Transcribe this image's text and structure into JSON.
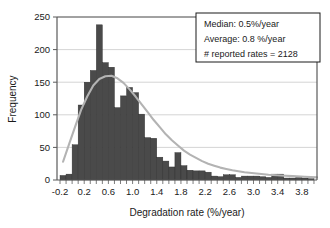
{
  "chart_data": {
    "type": "bar",
    "title": "",
    "xlabel": "Degradation rate (%/year)",
    "ylabel": "Frequency",
    "xlim": [
      -0.25,
      4.05
    ],
    "ylim": [
      0,
      250
    ],
    "ytick_values": [
      0,
      50,
      100,
      150,
      200,
      250
    ],
    "ytick_labels": [
      "0",
      "50",
      "100",
      "150",
      "200",
      "250"
    ],
    "xtick_labels": [
      "-0.2",
      "0.2",
      "0.6",
      "1.0",
      "1.4",
      "1.8",
      "2.2",
      "2.6",
      "3.0",
      "3.4",
      "3.8"
    ],
    "xtick_values": [
      -0.2,
      0.2,
      0.6,
      1.0,
      1.4,
      1.8,
      2.2,
      2.6,
      3.0,
      3.4,
      3.8
    ],
    "bin_width": 0.1,
    "grid": "horizontal",
    "legend_position": "none",
    "bar_color": "#4a4a4a",
    "curve_color": "#b3b3b3",
    "categories": [
      -0.2,
      -0.1,
      0.0,
      0.1,
      0.2,
      0.3,
      0.4,
      0.5,
      0.6,
      0.7,
      0.8,
      0.9,
      1.0,
      1.1,
      1.2,
      1.3,
      1.4,
      1.5,
      1.6,
      1.7,
      1.8,
      1.9,
      2.0,
      2.1,
      2.2,
      2.3,
      2.4,
      2.5,
      2.6,
      2.7,
      2.8,
      2.9,
      3.0,
      3.1,
      3.2,
      3.3,
      3.4,
      3.5,
      3.6,
      3.7,
      3.8,
      3.9
    ],
    "values": [
      7,
      9,
      54,
      115,
      150,
      168,
      238,
      180,
      173,
      111,
      129,
      142,
      134,
      101,
      65,
      64,
      35,
      29,
      20,
      42,
      22,
      15,
      14,
      14,
      12,
      6,
      5,
      8,
      8,
      4,
      6,
      6,
      6,
      5,
      4,
      9,
      9,
      3,
      3,
      4,
      3,
      2
    ],
    "fit_curve": {
      "name": "lognormal fit",
      "x": [
        -0.2,
        -0.1,
        0.0,
        0.1,
        0.2,
        0.3,
        0.4,
        0.5,
        0.6,
        0.7,
        0.8,
        0.9,
        1.0,
        1.1,
        1.2,
        1.3,
        1.4,
        1.5,
        1.6,
        1.7,
        1.8,
        1.9,
        2.0,
        2.1,
        2.2,
        2.3,
        2.4,
        2.5,
        2.6,
        2.8,
        3.0,
        3.2,
        3.4,
        3.6,
        3.8,
        4.0
      ],
      "y": [
        28,
        55,
        82,
        108,
        128,
        145,
        155,
        159,
        160,
        156,
        149,
        139,
        128,
        116,
        104,
        92,
        81,
        70,
        61,
        53,
        45,
        39,
        34,
        29,
        25,
        22,
        19,
        17,
        15,
        12,
        10,
        8,
        7,
        6,
        5,
        4
      ]
    },
    "annotations": [
      "Median: 0.5%/year",
      "Average: 0.8 %/year",
      "# reported rates = 2128"
    ]
  },
  "stats_box": {
    "median_label": "Median: 0.5%/year",
    "average_label": "Average: 0.8 %/year",
    "count_label": "# reported rates = 2128"
  },
  "axes": {
    "x_title": "Degradation rate (%/year)",
    "y_title": "Frequency"
  }
}
